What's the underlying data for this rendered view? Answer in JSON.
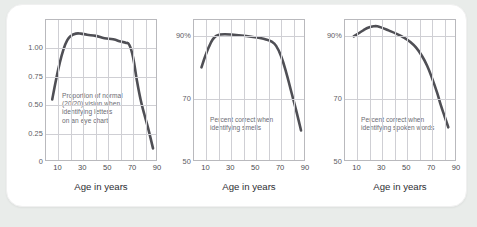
{
  "theme": {
    "page_background": "#e9ecea",
    "card_background": "#ffffff",
    "curve_color": "#4f4f55",
    "grid_color": "#cfcfd4",
    "frame_color": "#b9b9bd",
    "tick_text_color": "#4a4a50",
    "annotation_color": "#6b6b72"
  },
  "charts": [
    {
      "id": "vision-chart",
      "annotation": "Proportion of normal\n(20/20) vision when\nidentifying letters\non an eye chart",
      "annotation_x": 16,
      "annotation_y": 72,
      "xlabel": "Age in years",
      "yticks": [
        "1.00",
        "0.75",
        "0.50",
        "0.25",
        "0"
      ],
      "ytick_values": [
        1.0,
        0.75,
        0.5,
        0.25,
        0
      ],
      "xticks": [
        "10",
        "30",
        "50",
        "70",
        "90"
      ],
      "xtick_values": [
        10,
        30,
        50,
        70,
        90
      ]
    },
    {
      "id": "smell-chart",
      "annotation": "Percent correct when\nidentifying smells",
      "annotation_x": 16,
      "annotation_y": 96,
      "xlabel": "Age in years",
      "yticks": [
        "90%",
        "70",
        "50"
      ],
      "ytick_values": [
        90,
        70,
        50
      ],
      "xticks": [
        "10",
        "30",
        "50",
        "70",
        "90"
      ],
      "xtick_values": [
        10,
        30,
        50,
        70,
        90
      ]
    },
    {
      "id": "spoken-words-chart",
      "annotation": "Percent correct when\nidentifying spoken words",
      "annotation_x": 16,
      "annotation_y": 96,
      "xlabel": "Age in years",
      "yticks": [
        "90%",
        "70",
        "50"
      ],
      "ytick_values": [
        90,
        70,
        50
      ],
      "xticks": [
        "10",
        "30",
        "50",
        "70",
        "90"
      ],
      "xtick_values": [
        10,
        30,
        50,
        70,
        90
      ]
    }
  ],
  "chart_data": [
    {
      "type": "line",
      "title": "",
      "annotation": "Proportion of normal (20/20) vision when identifying letters on an eye chart",
      "xlabel": "Age in years",
      "ylabel": "",
      "xlim": [
        0,
        90
      ],
      "ylim": [
        0,
        1.25
      ],
      "xticks": [
        10,
        30,
        50,
        70,
        90
      ],
      "yticks": [
        0,
        0.25,
        0.5,
        0.75,
        1.0
      ],
      "ytick_labels": [
        "0",
        "0.25",
        "0.50",
        "0.75",
        "1.00"
      ],
      "grid": true,
      "legend": false,
      "series": [
        {
          "name": "Proportion of normal (20/20) vision",
          "x": [
            5,
            8,
            11,
            14,
            17,
            20,
            24,
            28,
            33,
            40,
            47,
            54,
            60,
            64,
            67,
            70,
            73,
            76,
            79,
            82,
            86
          ],
          "y": [
            0.55,
            0.72,
            0.87,
            0.99,
            1.07,
            1.11,
            1.13,
            1.13,
            1.12,
            1.11,
            1.09,
            1.08,
            1.06,
            1.05,
            1.03,
            0.92,
            0.72,
            0.55,
            0.42,
            0.3,
            0.12
          ]
        }
      ]
    },
    {
      "type": "line",
      "title": "",
      "annotation": "Percent correct when identifying smells",
      "xlabel": "Age in years",
      "ylabel": "",
      "xlim": [
        0,
        90
      ],
      "ylim": [
        50,
        95
      ],
      "xticks": [
        10,
        30,
        50,
        70,
        90
      ],
      "yticks": [
        50,
        70,
        90
      ],
      "ytick_labels": [
        "50",
        "70",
        "90%"
      ],
      "grid": true,
      "legend": false,
      "series": [
        {
          "name": "Percent correct identifying smells",
          "x": [
            6,
            9,
            12,
            15,
            18,
            21,
            25,
            30,
            38,
            46,
            54,
            58,
            62,
            66,
            70,
            74,
            78,
            82,
            86
          ],
          "y": [
            80.0,
            83.5,
            86.5,
            88.8,
            90.0,
            90.4,
            90.5,
            90.4,
            90.1,
            89.7,
            89.2,
            88.8,
            88.2,
            86.8,
            83.5,
            78.5,
            72.5,
            66.5,
            60.0
          ]
        }
      ]
    },
    {
      "type": "line",
      "title": "",
      "annotation": "Percent correct when identifying spoken words",
      "xlabel": "Age in years",
      "ylabel": "",
      "xlim": [
        0,
        90
      ],
      "ylim": [
        50,
        95
      ],
      "xticks": [
        10,
        30,
        50,
        70,
        90
      ],
      "yticks": [
        50,
        70,
        90
      ],
      "ytick_labels": [
        "50",
        "70",
        "90%"
      ],
      "grid": true,
      "legend": false,
      "series": [
        {
          "name": "Percent correct identifying spoken words",
          "x": [
            7,
            11,
            15,
            19,
            23,
            26,
            30,
            35,
            41,
            47,
            52,
            57,
            62,
            66,
            70,
            74,
            77,
            80,
            83
          ],
          "y": [
            89.8,
            90.8,
            91.8,
            92.6,
            93.0,
            93.0,
            92.5,
            91.7,
            90.7,
            89.5,
            88.2,
            86.3,
            83.5,
            80.5,
            76.5,
            72.0,
            68.0,
            64.5,
            61.0
          ]
        }
      ]
    }
  ]
}
